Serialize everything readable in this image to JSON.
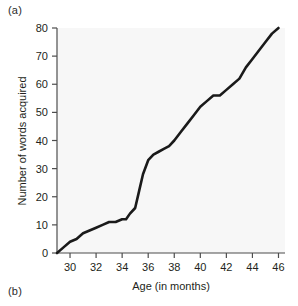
{
  "figure": {
    "panel_a_label": "(a)",
    "panel_b_label": "(b)"
  },
  "chart_data": {
    "type": "line",
    "title": "",
    "xlabel": "Age (in months)",
    "ylabel": "Number of words acquired",
    "xlim": [
      29,
      46.5
    ],
    "ylim": [
      0,
      80
    ],
    "xticks": [
      30,
      32,
      34,
      36,
      38,
      40,
      42,
      44,
      46
    ],
    "xtick_labels": [
      "30",
      "32",
      "34",
      "36",
      "38",
      "40",
      "42",
      "44",
      "46"
    ],
    "yticks": [
      0,
      10,
      20,
      30,
      40,
      50,
      60,
      70,
      80
    ],
    "ytick_labels": [
      "0",
      "10",
      "20",
      "30",
      "40",
      "50",
      "60",
      "70",
      "80"
    ],
    "grid": false,
    "legend": false,
    "line_color": "#1a1a1a",
    "line_width": 2.6,
    "plot_background": "#f7f7f7",
    "series": [
      {
        "name": "Words acquired",
        "x": [
          29.0,
          29.5,
          30.0,
          30.5,
          31.0,
          31.5,
          32.0,
          32.5,
          33.0,
          33.5,
          34.0,
          34.3,
          34.6,
          35.0,
          35.3,
          35.6,
          36.0,
          36.4,
          36.8,
          37.2,
          37.6,
          38.0,
          38.5,
          39.0,
          39.5,
          40.0,
          40.5,
          41.0,
          41.5,
          42.0,
          42.5,
          43.0,
          43.5,
          44.0,
          44.5,
          45.0,
          45.5,
          46.0
        ],
        "y": [
          0,
          2,
          4,
          5,
          7,
          8,
          9,
          10,
          11,
          11,
          12,
          12,
          14,
          16,
          22,
          28,
          33,
          35,
          36,
          37,
          38,
          40,
          43,
          46,
          49,
          52,
          54,
          56,
          56,
          58,
          60,
          62,
          66,
          69,
          72,
          75,
          78,
          80
        ]
      }
    ]
  }
}
